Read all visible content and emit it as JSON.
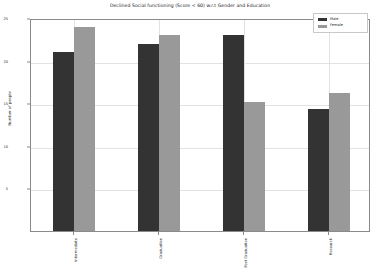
{
  "chart_data": {
    "type": "bar",
    "title": "Declined Social functioning (Score < 60) w.r.t Gender and Education",
    "xlabel": "",
    "ylabel": "Number of people",
    "categories": [
      "Intermediate",
      "Graduation",
      "Post Graduation",
      "Research"
    ],
    "series": [
      {
        "name": "Male",
        "color": "#333333",
        "values": [
          21,
          22,
          23,
          14.3
        ]
      },
      {
        "name": "Female",
        "color": "#999999",
        "values": [
          24,
          23,
          15.2,
          16.2
        ]
      }
    ],
    "ylim": [
      0,
      25
    ],
    "yticks": [
      5,
      10,
      15,
      20,
      25
    ],
    "ytick_labels": [
      "5",
      "10",
      "15",
      "20",
      "25"
    ],
    "grid": true,
    "legend_position": "upper right"
  },
  "legend": {
    "entries": [
      {
        "label": "Male"
      },
      {
        "label": "Female"
      }
    ]
  }
}
